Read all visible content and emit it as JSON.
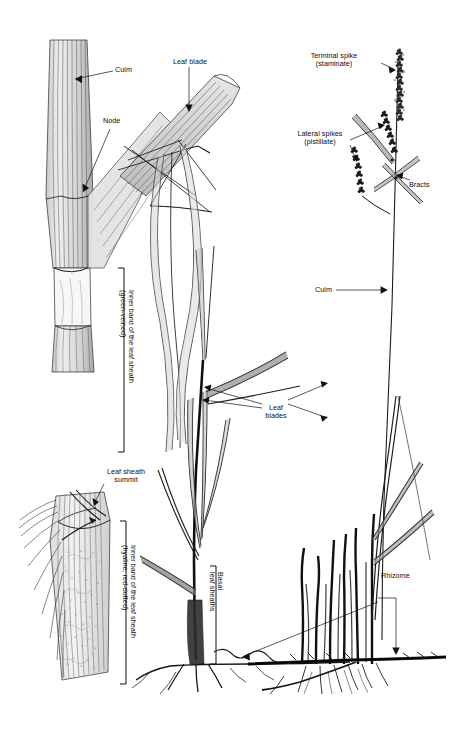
{
  "figure": {
    "kind": "botanical-line-illustration",
    "background_color": "#ffffff",
    "ink_color": "#111111",
    "shade_color": "#9a9a9a",
    "width": 450,
    "height": 743
  },
  "labels": {
    "culm_detail": "Culm",
    "node": "Node",
    "leaf_blade": "Leaf blade",
    "inner_band_green": "Inner band of the leaf sheath\n(green-veined)",
    "leaf_sheath_summit": "Leaf sheath\nsummit",
    "inner_band_hyaline": "Inner band of the leaf sheath\n(hyaline, red-dotted)",
    "leaf_blades": "Leaf\nblades",
    "basal_leaf_sheaths": "Basal\nleaf sheaths",
    "terminal_spike": "Terminal spike\n(staminate)",
    "lateral_spikes": "Lateral spikes\n(pistillate)",
    "bracts": "Bracts",
    "culm_habit": "Culm",
    "rhizome": "Rhizome"
  },
  "panels": [
    {
      "name": "culm-node-detail",
      "position": "upper-left"
    },
    {
      "name": "leaf-sheath-detail",
      "position": "lower-left"
    },
    {
      "name": "whole-plant-habit",
      "position": "center"
    },
    {
      "name": "inflorescence-detail",
      "position": "upper-right"
    },
    {
      "name": "rhizome-clump",
      "position": "lower-right"
    }
  ]
}
